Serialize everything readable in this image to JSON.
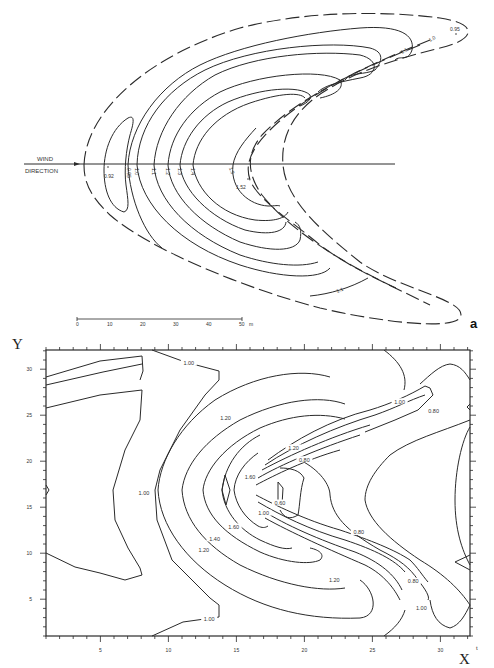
{
  "chart_data": [
    {
      "type": "heatmap",
      "subtype": "contour",
      "panel_label": "a",
      "title": "",
      "annotation_wind": [
        "WIND",
        "DIRECTION"
      ],
      "scale_bar": {
        "ticks": [
          "0",
          "10",
          "20",
          "30",
          "40",
          "50"
        ],
        "unit": "m"
      },
      "contour_levels": [
        "0.92",
        "0.95",
        "1.0",
        "1.1",
        "1.2",
        "1.3",
        "1.4",
        "1.5",
        "1.52"
      ],
      "point_labels": [
        {
          "text": "0.92",
          "meaning": "local minimum near windward edge"
        },
        {
          "text": "1.52",
          "meaning": "local maximum"
        },
        {
          "text": "0.95",
          "meaning": "local minimum near upper tip"
        }
      ],
      "labels_on_axis": [
        "0.95",
        "1.0",
        "1.1",
        "1.2",
        "1.3",
        "1.4",
        "1.5"
      ],
      "other_labels": [
        "1.1",
        "1.0",
        "1.1"
      ],
      "dashed_outline": "boomerang-shaped region boundary"
    },
    {
      "type": "heatmap",
      "subtype": "contour",
      "title": "",
      "xlabel": "X",
      "ylabel": "Y",
      "corner_label": "t",
      "xlim": [
        1,
        32
      ],
      "ylim": [
        1,
        32
      ],
      "xticks": [
        "5",
        "10",
        "15",
        "20",
        "25",
        "30"
      ],
      "yticks": [
        "5",
        "10",
        "15",
        "20",
        "25",
        "30"
      ],
      "grid": false,
      "contour_labels": [
        {
          "text": "1.00",
          "x": 11.5,
          "y": 30.6
        },
        {
          "text": "1.00",
          "x": 8.2,
          "y": 16.5
        },
        {
          "text": "1.20",
          "x": 14.2,
          "y": 24.6
        },
        {
          "text": "1.20",
          "x": 19.2,
          "y": 21.4
        },
        {
          "text": "0.80",
          "x": 20.0,
          "y": 20.1
        },
        {
          "text": "1.00",
          "x": 27.0,
          "y": 26.4
        },
        {
          "text": "0.80",
          "x": 29.5,
          "y": 25.4
        },
        {
          "text": "1.60",
          "x": 16.0,
          "y": 18.2
        },
        {
          "text": "0.60",
          "x": 18.2,
          "y": 15.4
        },
        {
          "text": "1.00",
          "x": 17.0,
          "y": 14.3
        },
        {
          "text": "1.60",
          "x": 14.8,
          "y": 12.8
        },
        {
          "text": "1.40",
          "x": 13.4,
          "y": 11.5
        },
        {
          "text": "1.20",
          "x": 12.6,
          "y": 10.3
        },
        {
          "text": "0.80",
          "x": 24.0,
          "y": 12.2
        },
        {
          "text": "1.20",
          "x": 22.2,
          "y": 7.0
        },
        {
          "text": "0.80",
          "x": 28.0,
          "y": 6.9
        },
        {
          "text": "1.00",
          "x": 28.6,
          "y": 4.0
        },
        {
          "text": "1.00",
          "x": 13.0,
          "y": 2.8
        }
      ],
      "levels": [
        "0.60",
        "0.80",
        "1.00",
        "1.20",
        "1.40",
        "1.60"
      ],
      "description": "Symmetric chevron-shaped contour field about Y≈16.5; maximum (~1.6+) near X≈14, Y≈17; minimum (~0.6) near X≈18, Y≈16.5; band of tightly packed contours curving from (X≈29,Y≈28) through (X≈16,Y≈16.5) to (X≈29,Y≈5)."
    }
  ],
  "figure_a": {
    "wind_line1": "WIND",
    "wind_line2": "DIRECTION",
    "panel": "a",
    "labels": {
      "min1": "0.92",
      "l095": "0.95",
      "l10": "1.0",
      "l11": "1.1",
      "l12": "1.2",
      "l13": "1.3",
      "l14": "1.4",
      "l15": "1.5",
      "max": "1.52",
      "tip_min": "0.95",
      "tip_10": "1.0",
      "tip_11": "1.1",
      "bot_11": "1.1"
    },
    "scale": [
      "0",
      "10",
      "20",
      "30",
      "40",
      "50"
    ],
    "scale_unit": "m"
  },
  "figure_b": {
    "x_axis_label": "X",
    "y_axis_label": "Y",
    "corner": "t",
    "xticks": [
      {
        "v": 5,
        "label": "5"
      },
      {
        "v": 10,
        "label": "10"
      },
      {
        "v": 15,
        "label": "15"
      },
      {
        "v": 20,
        "label": "20"
      },
      {
        "v": 25,
        "label": "25"
      },
      {
        "v": 30,
        "label": "30"
      }
    ],
    "yticks": [
      {
        "v": 5,
        "label": "5"
      },
      {
        "v": 10,
        "label": "10"
      },
      {
        "v": 15,
        "label": "15"
      },
      {
        "v": 20,
        "label": "20"
      },
      {
        "v": 25,
        "label": "25"
      },
      {
        "v": 30,
        "label": "30"
      }
    ]
  }
}
